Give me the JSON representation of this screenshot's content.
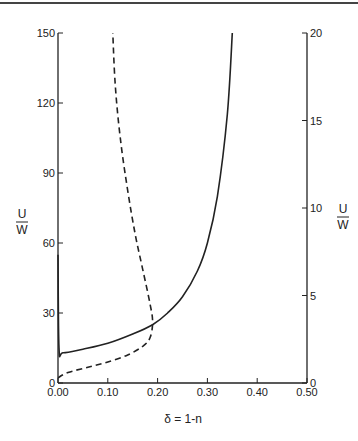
{
  "chart_data": {
    "type": "line",
    "title": "",
    "xlabel": "δ = 1-n",
    "ylabel_left": "U/W",
    "ylabel_right": "U/W",
    "xlim": [
      0.0,
      0.5
    ],
    "ylim_left": [
      0,
      150
    ],
    "ylim_right": [
      0,
      20
    ],
    "x_ticks": [
      "0.00",
      "0.10",
      "0.20",
      "0.30",
      "0.40",
      "0.50"
    ],
    "y_ticks_left": [
      "0",
      "30",
      "60",
      "90",
      "120",
      "150"
    ],
    "y_ticks_right": [
      "0",
      "5",
      "10",
      "15",
      "20"
    ],
    "grid": false,
    "legend": "none",
    "series": [
      {
        "name": "solid (left axis)",
        "style": "solid",
        "axis": "left",
        "x": [
          0.0,
          0.002,
          0.01,
          0.05,
          0.1,
          0.15,
          0.19,
          0.22,
          0.25,
          0.28,
          0.3,
          0.32,
          0.34,
          0.35
        ],
        "y": [
          55,
          15,
          13,
          14.5,
          17,
          21,
          25,
          30,
          37,
          48,
          60,
          80,
          115,
          150
        ]
      },
      {
        "name": "dashed (right axis)",
        "style": "dashed",
        "axis": "right",
        "x": [
          0.0,
          0.02,
          0.06,
          0.1,
          0.14,
          0.17,
          0.185,
          0.19,
          0.185,
          0.17,
          0.155,
          0.14,
          0.125,
          0.115,
          0.11
        ],
        "y": [
          0.3,
          0.6,
          0.9,
          1.2,
          1.6,
          2.1,
          2.6,
          3.5,
          4.5,
          6.5,
          8.5,
          11,
          14,
          17,
          20
        ]
      }
    ]
  },
  "labels": {
    "left_U": "U",
    "left_W": "W",
    "right_U": "U",
    "right_W": "W",
    "x_axis_title": "δ = 1-n"
  }
}
